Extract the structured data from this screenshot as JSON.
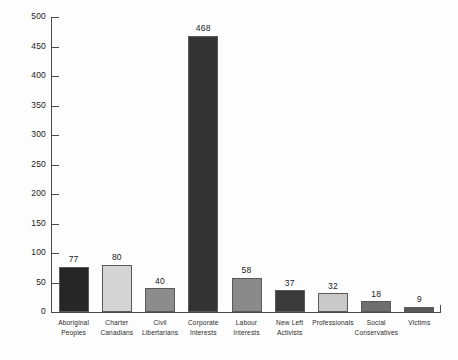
{
  "chart_data": {
    "type": "bar",
    "title": "",
    "subtitle": "",
    "xlabel": "",
    "ylabel": "",
    "ylim": [
      0,
      500
    ],
    "ytick_step": 50,
    "yticks": [
      500,
      450,
      400,
      350,
      300,
      250,
      200,
      150,
      100,
      50,
      0
    ],
    "grid": false,
    "legend": null,
    "show_value_labels": true,
    "categories": [
      "Aboriginal Peoples",
      "Charter Canadians",
      "Civil Libertarians",
      "Corporate Interests",
      "Labour Interests",
      "New Left Activists",
      "Professionals",
      "Social Conservatives",
      "Victims"
    ],
    "category_lines": [
      [
        "Aboriginal",
        "Peoples"
      ],
      [
        "Charter",
        "Canadians"
      ],
      [
        "Civil",
        "Libertarians"
      ],
      [
        "Corporate",
        "Interests"
      ],
      [
        "Labour",
        "Interests"
      ],
      [
        "New Left",
        "Activists"
      ],
      [
        "Professionals",
        ""
      ],
      [
        "Social",
        "Conservatives"
      ],
      [
        "Victims",
        ""
      ]
    ],
    "values": [
      77,
      80,
      40,
      468,
      58,
      37,
      32,
      18,
      9
    ],
    "bar_colors": [
      "#262626",
      "#d4d4d4",
      "#8c8c8c",
      "#333333",
      "#8a8a8a",
      "#3a3a3a",
      "#c9c9c9",
      "#6e6e6e",
      "#575757"
    ]
  },
  "style": {
    "background": "#fdfdfd",
    "axis_color": "#4a4a4a",
    "text_color": "#1a1a1a"
  }
}
